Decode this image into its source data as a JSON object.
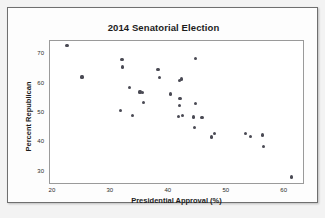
{
  "chart_data": {
    "type": "scatter",
    "title": "2014 Senatorial Election",
    "xlabel": "Presidential Approval (%)",
    "ylabel": "Percent Republican",
    "xlim": [
      19.5,
      63.5
    ],
    "ylim": [
      25.5,
      74.5
    ],
    "xticks": [
      20,
      30,
      40,
      50,
      60
    ],
    "yticks": [
      30,
      40,
      50,
      60,
      70
    ],
    "grid": false,
    "legend": null,
    "marker": "filled-circle",
    "marker_color": "#4a4a54",
    "points": [
      {
        "x": 22.6,
        "y": 72.7
      },
      {
        "x": 25.2,
        "y": 61.9
      },
      {
        "x": 32.1,
        "y": 67.9
      },
      {
        "x": 32.2,
        "y": 65.3
      },
      {
        "x": 31.9,
        "y": 50.6
      },
      {
        "x": 33.4,
        "y": 58.2
      },
      {
        "x": 33.9,
        "y": 48.7
      },
      {
        "x": 35.2,
        "y": 56.8
      },
      {
        "x": 35.6,
        "y": 56.5
      },
      {
        "x": 35.8,
        "y": 53.3
      },
      {
        "x": 38.3,
        "y": 64.5
      },
      {
        "x": 38.6,
        "y": 61.8
      },
      {
        "x": 40.4,
        "y": 56.1
      },
      {
        "x": 42.0,
        "y": 60.7
      },
      {
        "x": 42.3,
        "y": 61.2
      },
      {
        "x": 42.1,
        "y": 54.6
      },
      {
        "x": 42.0,
        "y": 52.3
      },
      {
        "x": 41.8,
        "y": 48.4
      },
      {
        "x": 42.6,
        "y": 48.8
      },
      {
        "x": 44.8,
        "y": 68.3
      },
      {
        "x": 44.4,
        "y": 48.3
      },
      {
        "x": 44.8,
        "y": 52.8
      },
      {
        "x": 45.9,
        "y": 48.2
      },
      {
        "x": 44.6,
        "y": 44.6
      },
      {
        "x": 47.6,
        "y": 41.5
      },
      {
        "x": 48.1,
        "y": 42.6
      },
      {
        "x": 53.4,
        "y": 42.6
      },
      {
        "x": 54.2,
        "y": 41.8
      },
      {
        "x": 56.4,
        "y": 42.2
      },
      {
        "x": 56.5,
        "y": 38.2
      },
      {
        "x": 61.3,
        "y": 27.9
      }
    ]
  }
}
